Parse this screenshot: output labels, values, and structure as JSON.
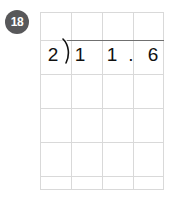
{
  "problem": {
    "number": "18",
    "type": "long-division",
    "divisor": "2",
    "dividend": "11.6",
    "expression": "2 ) 1 1 . 6",
    "digits": {
      "divisor": "2",
      "dividend_ones": "1",
      "dividend_tens": "1",
      "decimal_point": ".",
      "dividend_tenths": "6"
    }
  },
  "grid": {
    "columns": 4,
    "rows": 5
  },
  "colors": {
    "badge_background": "#58585a",
    "badge_text": "#ffffff",
    "grid_line": "#d9d9d9",
    "vinculum": "#707070",
    "digit": "#111111",
    "page_background": "#ffffff"
  },
  "icons": {
    "division_bracket": "division-bracket-icon"
  }
}
